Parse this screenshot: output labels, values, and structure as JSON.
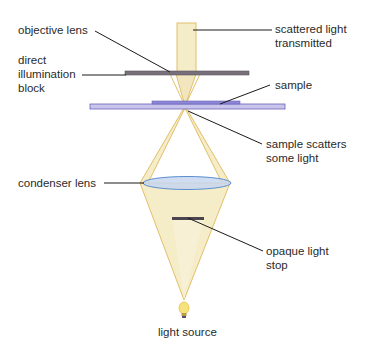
{
  "labels": {
    "objective_lens": "objective lens",
    "direct_illumination_block": "direct\nillumination\nblock",
    "scattered_light": "scattered light\ntransmitted",
    "sample": "sample",
    "sample_scatters": "sample scatters\nsome light",
    "condenser_lens": "condenser lens",
    "opaque_light_stop": "opaque light\nstop",
    "light_source": "light source"
  },
  "colors": {
    "light_fill": "#f5ecc8",
    "light_stroke": "#e2c06a",
    "block": "#77707a",
    "slide": "#c9c4ec",
    "slide_stroke": "#6a62b8",
    "lens_fill": "#c7d6ee",
    "lens_stroke": "#5b8ed0",
    "stop": "#4b4550",
    "leader": "#1a1a1a"
  }
}
